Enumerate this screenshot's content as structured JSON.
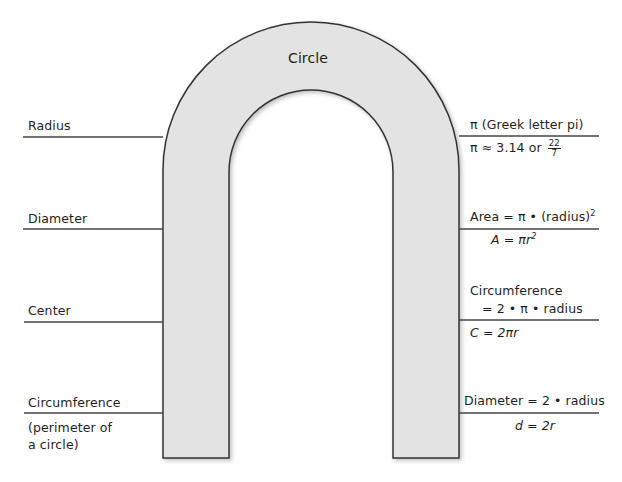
{
  "title": "Circle",
  "colors": {
    "fill": "#e3e3e3",
    "stroke": "#333333",
    "line": "#444444"
  },
  "left_labels": [
    {
      "term": "Radius",
      "note": ""
    },
    {
      "term": "Diameter",
      "note": ""
    },
    {
      "term": "Center",
      "note": ""
    },
    {
      "term": "Circumference",
      "note_line1": "(perimeter of",
      "note_line2": "a circle)"
    }
  ],
  "right_labels": {
    "pi": {
      "above": "π  (Greek letter pi)",
      "below_prefix": "π ≈ 3.14 or ",
      "frac_num": "22",
      "frac_den": "7"
    },
    "area": {
      "above": "Area = π • (radius)",
      "above_sup": "2",
      "below": "A = πr",
      "below_sup": "2"
    },
    "circumference": {
      "above_line1": "Circumference",
      "above_line2": "= 2 • π • radius",
      "below": "C = 2πr"
    },
    "diameter": {
      "above": "Diameter = 2 • radius",
      "below": "d = 2r"
    }
  }
}
